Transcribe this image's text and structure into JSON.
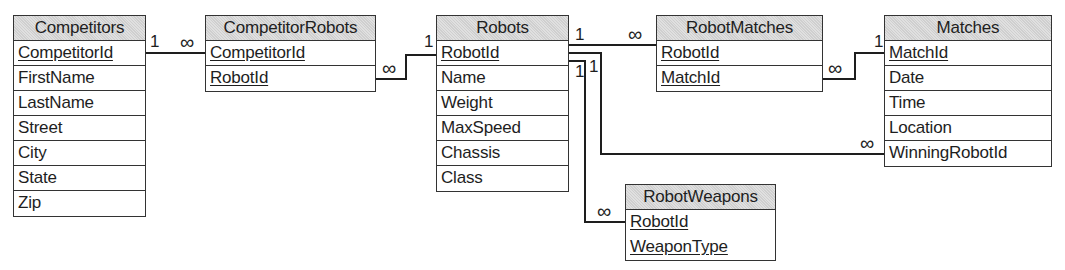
{
  "diagram": {
    "type": "entity-relationship",
    "tables": [
      {
        "name": "Competitors",
        "fields": [
          {
            "name": "CompetitorId",
            "pk": true
          },
          {
            "name": "FirstName",
            "pk": false
          },
          {
            "name": "LastName",
            "pk": false
          },
          {
            "name": "Street",
            "pk": false
          },
          {
            "name": "City",
            "pk": false
          },
          {
            "name": "State",
            "pk": false
          },
          {
            "name": "Zip",
            "pk": false
          }
        ]
      },
      {
        "name": "CompetitorRobots",
        "fields": [
          {
            "name": "CompetitorId",
            "pk": true
          },
          {
            "name": "RobotId",
            "pk": true
          }
        ]
      },
      {
        "name": "Robots",
        "fields": [
          {
            "name": "RobotId",
            "pk": true
          },
          {
            "name": "Name",
            "pk": false
          },
          {
            "name": "Weight",
            "pk": false
          },
          {
            "name": "MaxSpeed",
            "pk": false
          },
          {
            "name": "Chassis",
            "pk": false
          },
          {
            "name": "Class",
            "pk": false
          }
        ]
      },
      {
        "name": "RobotMatches",
        "fields": [
          {
            "name": "RobotId",
            "pk": true
          },
          {
            "name": "MatchId",
            "pk": true
          }
        ]
      },
      {
        "name": "Matches",
        "fields": [
          {
            "name": "MatchId",
            "pk": true
          },
          {
            "name": "Date",
            "pk": false
          },
          {
            "name": "Time",
            "pk": false
          },
          {
            "name": "Location",
            "pk": false
          },
          {
            "name": "WinningRobotId",
            "pk": false
          }
        ]
      },
      {
        "name": "RobotWeapons",
        "fields": [
          {
            "name": "RobotId",
            "pk": true
          },
          {
            "name": "WeaponType",
            "pk": true
          }
        ]
      }
    ],
    "relationships": [
      {
        "from": "Competitors.CompetitorId",
        "to": "CompetitorRobots.CompetitorId",
        "from_card": "1",
        "to_card": "∞"
      },
      {
        "from": "Robots.RobotId",
        "to": "CompetitorRobots.RobotId",
        "from_card": "1",
        "to_card": "∞"
      },
      {
        "from": "Robots.RobotId",
        "to": "RobotMatches.RobotId",
        "from_card": "1",
        "to_card": "∞"
      },
      {
        "from": "Matches.MatchId",
        "to": "RobotMatches.MatchId",
        "from_card": "1",
        "to_card": "∞"
      },
      {
        "from": "Robots.RobotId",
        "to": "Matches.WinningRobotId",
        "from_card": "1",
        "to_card": "∞"
      },
      {
        "from": "Robots.RobotId",
        "to": "RobotWeapons.RobotId",
        "from_card": "1",
        "to_card": "∞"
      }
    ],
    "labels": {
      "one": "1",
      "many": "∞"
    },
    "colors": {
      "header_fill": "#cfcfcf",
      "border": "#333333",
      "line": "#1e1e1e"
    }
  }
}
